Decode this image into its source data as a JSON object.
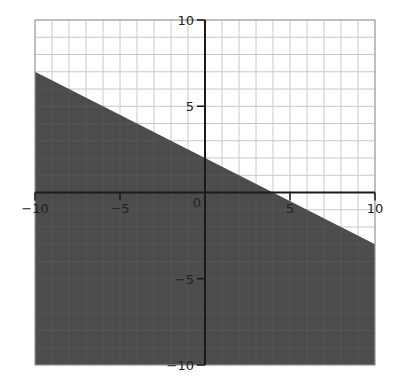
{
  "chart_data": {
    "type": "area",
    "title": "",
    "xlabel": "",
    "ylabel": "",
    "xlim": [
      -10,
      10
    ],
    "ylim": [
      -10,
      10
    ],
    "grid": true,
    "grid_step": 1,
    "x_ticks": [
      -10,
      -5,
      0,
      5,
      10
    ],
    "y_ticks": [
      -10,
      -5,
      5,
      10
    ],
    "x_tick_labels": [
      "−10",
      "−5",
      "0",
      "5",
      "10"
    ],
    "y_tick_labels": [
      "−10",
      "−5",
      "5",
      "10"
    ],
    "boundary_line": {
      "equation": "y = -0.5x + 2",
      "slope": -0.5,
      "intercept": 2,
      "points": [
        [
          -10,
          7
        ],
        [
          0,
          2
        ],
        [
          4,
          0
        ],
        [
          10,
          -3
        ]
      ],
      "style": "solid"
    },
    "shaded_region": {
      "inequality": "y <= -0.5x + 2",
      "side": "below",
      "polygon": [
        [
          -10,
          7
        ],
        [
          10,
          -3
        ],
        [
          10,
          -10
        ],
        [
          -10,
          -10
        ]
      ]
    },
    "colors": {
      "shade": "#4d4d4d",
      "grid": "#c8c8c8",
      "axis": "#1a1a1a",
      "background": "#ffffff"
    }
  }
}
